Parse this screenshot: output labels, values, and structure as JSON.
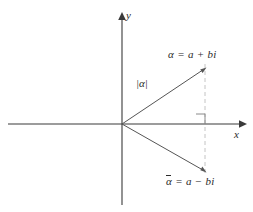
{
  "figure": {
    "axes": {
      "x_label": "x",
      "y_label": "y",
      "origin": [
        122,
        124
      ],
      "x_axis_from": [
        8,
        124
      ],
      "x_axis_to": [
        243,
        124
      ],
      "y_axis_from": [
        122,
        205
      ],
      "y_axis_to": [
        122,
        16
      ]
    },
    "points": [
      {
        "name": "alpha",
        "label_alpha": "α",
        "label_rest": " = a + bi",
        "coords": [
          205,
          68
        ],
        "label_pos": [
          168,
          50
        ]
      },
      {
        "name": "alpha-conjugate",
        "label_alpha": "α",
        "label_overline": true,
        "label_rest": " = a − bi",
        "coords": [
          205,
          172
        ],
        "label_pos": [
          166,
          177
        ]
      }
    ],
    "modulus": {
      "label": "|α|",
      "pos": [
        136,
        79
      ]
    },
    "right_angle_marker": {
      "name": "right-angle-marker",
      "corner": [
        205,
        124
      ],
      "size": 9
    },
    "dashed_line": {
      "from": [
        205,
        68
      ],
      "to": [
        205,
        172
      ],
      "color": "#bdbdbd"
    },
    "colors": {
      "axis": "#3a3a3a",
      "vector": "#555555",
      "dashed": "#bdbdbd",
      "text": "#2b2b2b",
      "background": "#ffffff"
    }
  }
}
